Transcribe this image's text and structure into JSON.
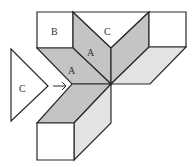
{
  "diagram": {
    "type": "geometric-net",
    "colors": {
      "background": "#ffffff",
      "stroke": "#2a2a2a",
      "face_dark": "#c4c4c4",
      "face_light": "#e3e3e3",
      "face_white": "#ffffff",
      "label": "#333333"
    },
    "labels": {
      "b_square": "B",
      "c_top": "C",
      "a_upper": "A",
      "a_lower": "A",
      "c_left": "C"
    },
    "arrow": {
      "direction": "right",
      "glyph": "→"
    }
  }
}
